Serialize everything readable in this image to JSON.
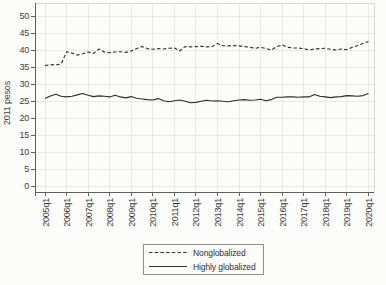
{
  "chart_data": {
    "type": "line",
    "title": "",
    "xlabel": "",
    "ylabel": "2011 pesos",
    "ylim": [
      0,
      50
    ],
    "y_ticks": [
      0,
      5,
      10,
      15,
      20,
      25,
      30,
      35,
      40,
      45,
      50
    ],
    "grid": true,
    "legend_position": "bottom",
    "grid_color": "#e4e4e4",
    "frame_color": "#d7d7d7",
    "axis_color": "#5f5f5f",
    "line_color": "#2e2e2e",
    "background_color": "#fcfcfb",
    "x": [
      "2005q1",
      "2005q2",
      "2005q3",
      "2005q4",
      "2006q1",
      "2006q2",
      "2006q3",
      "2006q4",
      "2007q1",
      "2007q2",
      "2007q3",
      "2007q4",
      "2008q1",
      "2008q2",
      "2008q3",
      "2008q4",
      "2009q1",
      "2009q2",
      "2009q3",
      "2009q4",
      "2010q1",
      "2010q2",
      "2010q3",
      "2010q4",
      "2011q1",
      "2011q2",
      "2011q3",
      "2011q4",
      "2012q1",
      "2012q2",
      "2012q3",
      "2012q4",
      "2013q1",
      "2013q2",
      "2013q3",
      "2013q4",
      "2014q1",
      "2014q2",
      "2014q3",
      "2014q4",
      "2015q1",
      "2015q2",
      "2015q3",
      "2015q4",
      "2016q1",
      "2016q2",
      "2016q3",
      "2016q4",
      "2017q1",
      "2017q2",
      "2017q3",
      "2017q4",
      "2018q1",
      "2018q2",
      "2018q3",
      "2018q4",
      "2019q1",
      "2019q2",
      "2019q3",
      "2019q4",
      "2020q1"
    ],
    "x_tick_labels": [
      "2005q1",
      "2006q1",
      "2007q1",
      "2008q1",
      "2009q1",
      "2010q1",
      "2011q1",
      "2012q1",
      "2013q1",
      "2014q1",
      "2015q1",
      "2016q1",
      "2017q1",
      "2018q1",
      "2019q1",
      "2020q1"
    ],
    "series": [
      {
        "name": "Nonglobalized",
        "style": "dashed",
        "color": "#2e2e2e",
        "values": [
          35.4,
          35.7,
          35.6,
          35.9,
          39.5,
          39.1,
          38.5,
          38.9,
          39.4,
          39.0,
          40.3,
          39.4,
          39.2,
          39.4,
          39.5,
          39.3,
          39.7,
          40.4,
          41.0,
          40.4,
          40.2,
          40.4,
          40.3,
          40.5,
          40.6,
          39.7,
          41.0,
          40.9,
          41.0,
          41.1,
          40.9,
          41.0,
          41.9,
          41.3,
          41.2,
          41.3,
          41.2,
          41.0,
          40.8,
          40.5,
          40.8,
          40.4,
          40.0,
          41.0,
          41.5,
          40.8,
          40.6,
          40.6,
          40.4,
          40.0,
          40.3,
          40.4,
          40.5,
          40.2,
          40.0,
          40.3,
          40.1,
          40.8,
          41.3,
          41.9,
          42.5
        ]
      },
      {
        "name": "Highly globalized",
        "style": "solid",
        "color": "#2e2e2e",
        "values": [
          25.7,
          26.5,
          27.0,
          26.4,
          26.2,
          26.4,
          26.8,
          27.2,
          26.7,
          26.3,
          26.5,
          26.4,
          26.2,
          26.7,
          26.2,
          25.9,
          26.3,
          25.8,
          25.6,
          25.4,
          25.3,
          25.7,
          25.1,
          24.8,
          25.1,
          25.3,
          24.9,
          24.5,
          24.6,
          24.9,
          25.2,
          25.0,
          25.1,
          24.9,
          24.8,
          25.1,
          25.3,
          25.4,
          25.2,
          25.3,
          25.5,
          25.1,
          25.4,
          26.1,
          26.1,
          26.2,
          26.2,
          26.1,
          26.2,
          26.2,
          26.9,
          26.4,
          26.2,
          26.0,
          26.2,
          26.3,
          26.6,
          26.5,
          26.4,
          26.6,
          27.2
        ]
      }
    ]
  }
}
